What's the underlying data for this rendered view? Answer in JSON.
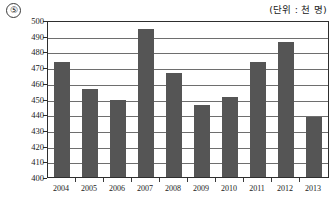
{
  "header": {
    "item_number": "⑤",
    "unit_label": "(단위 : 천 명)"
  },
  "chart_data": {
    "type": "bar",
    "title": "",
    "subtitle": "",
    "xlabel": "",
    "ylabel": "",
    "unit_note": "(단위 : 천 명)",
    "categories": [
      "2004",
      "2005",
      "2006",
      "2007",
      "2008",
      "2009",
      "2010",
      "2011",
      "2012",
      "2013"
    ],
    "values": [
      473,
      456,
      449,
      494,
      466,
      446,
      451,
      473,
      486,
      438
    ],
    "ylim": [
      400,
      500
    ],
    "ytick_step": 10,
    "yticks": [
      400,
      410,
      420,
      430,
      440,
      450,
      460,
      470,
      480,
      490,
      500
    ],
    "grid": true,
    "legend": "none",
    "series": [
      {
        "name": "",
        "values": [
          473,
          456,
          449,
          494,
          466,
          446,
          451,
          473,
          486,
          438
        ],
        "color": "#555555"
      }
    ]
  }
}
